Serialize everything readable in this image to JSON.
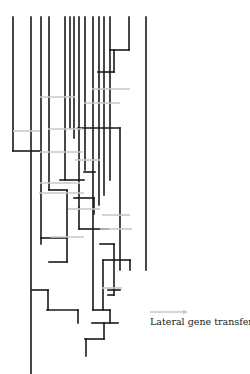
{
  "legend": {
    "label": "Lateral gene transfer",
    "arrow_color": "#c8c8c8"
  },
  "colors": {
    "branch": "#1a1a1a",
    "lateral_transfer": "#c8c8c8"
  },
  "tree": {
    "branches": [
      [
        13,
        17,
        13,
        151
      ],
      [
        13,
        151,
        40,
        151
      ],
      [
        31,
        17,
        31,
        374
      ],
      [
        41,
        17,
        41,
        238
      ],
      [
        41,
        238,
        67,
        238
      ],
      [
        49,
        17,
        49,
        190
      ],
      [
        49,
        190,
        67,
        190
      ],
      [
        65,
        17,
        65,
        180
      ],
      [
        70,
        17,
        70,
        128
      ],
      [
        74,
        17,
        74,
        138
      ],
      [
        79,
        17,
        79,
        207
      ],
      [
        85,
        17,
        85,
        170
      ],
      [
        93,
        17,
        93,
        310
      ],
      [
        99,
        17,
        99,
        205
      ],
      [
        104,
        17,
        104,
        195
      ],
      [
        110,
        17,
        110,
        180
      ],
      [
        129,
        17,
        129,
        50
      ],
      [
        110,
        50,
        129,
        50
      ],
      [
        114,
        50,
        114,
        72
      ],
      [
        98,
        72,
        114,
        72
      ],
      [
        146,
        17,
        146,
        270
      ],
      [
        78,
        128,
        120,
        128
      ],
      [
        120,
        128,
        120,
        270
      ],
      [
        67,
        190,
        67,
        262
      ],
      [
        67,
        262,
        49,
        262
      ],
      [
        84,
        172,
        95,
        172
      ],
      [
        60,
        180,
        84,
        180
      ],
      [
        74,
        198,
        94,
        198
      ],
      [
        94,
        198,
        94,
        214
      ],
      [
        79,
        207,
        79,
        229
      ],
      [
        79,
        229,
        108,
        229
      ],
      [
        41,
        238,
        41,
        244
      ],
      [
        100,
        244,
        114,
        244
      ],
      [
        114,
        244,
        114,
        295
      ],
      [
        103,
        260,
        130,
        260
      ],
      [
        103,
        260,
        103,
        310
      ],
      [
        130,
        260,
        130,
        270
      ],
      [
        32,
        290,
        48,
        290
      ],
      [
        48,
        290,
        48,
        310
      ],
      [
        47,
        310,
        78,
        310
      ],
      [
        78,
        310,
        78,
        323
      ],
      [
        93,
        310,
        110,
        310
      ],
      [
        110,
        310,
        110,
        323
      ],
      [
        92,
        323,
        118,
        323
      ],
      [
        108,
        290,
        120,
        290
      ],
      [
        108,
        295,
        114,
        295
      ],
      [
        85,
        339,
        104,
        339
      ],
      [
        104,
        339,
        104,
        323
      ],
      [
        86,
        339,
        86,
        356
      ]
    ],
    "lateral_transfers": [
      [
        40,
        97,
        75,
        97
      ],
      [
        92,
        89,
        130,
        89
      ],
      [
        84,
        103,
        120,
        103
      ],
      [
        13,
        131,
        40,
        131
      ],
      [
        48,
        129,
        83,
        129
      ],
      [
        40,
        152,
        83,
        152
      ],
      [
        75,
        160,
        100,
        160
      ],
      [
        40,
        183,
        80,
        183
      ],
      [
        39,
        193,
        84,
        193
      ],
      [
        68,
        209,
        100,
        209
      ],
      [
        102,
        215,
        130,
        215
      ],
      [
        50,
        237,
        84,
        237
      ],
      [
        100,
        229,
        132,
        229
      ],
      [
        102,
        288,
        122,
        288
      ]
    ]
  }
}
